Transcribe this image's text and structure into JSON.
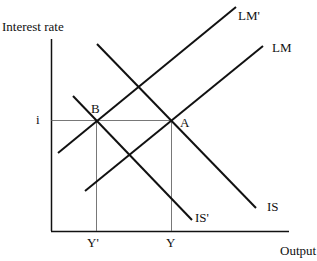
{
  "diagram": {
    "y_axis_label": "Interest rate",
    "x_axis_label": "Output",
    "interest_level_label": "i",
    "output_labels": {
      "y_prime": "Y'",
      "y": "Y"
    },
    "points": {
      "a": "A",
      "b": "B"
    },
    "curves": {
      "lm_prime": "LM'",
      "lm": "LM",
      "is": "IS",
      "is_prime": "IS'"
    },
    "colors": {
      "curve": "#111111",
      "axis": "#111111",
      "guide": "#555555"
    }
  }
}
